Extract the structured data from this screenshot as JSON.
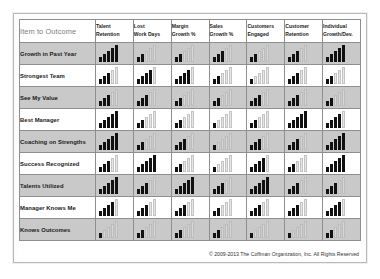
{
  "header": {
    "corner_label": "Item to Outcome",
    "columns": [
      {
        "line1": "Talent",
        "line2": "Retention"
      },
      {
        "line1": "Lost",
        "line2": "Work Days"
      },
      {
        "line1": "Margin",
        "line2": "Growth %"
      },
      {
        "line1": "Sales",
        "line2": "Growth %"
      },
      {
        "line1": "Customers",
        "line2": "Engaged"
      },
      {
        "line1": "Customer",
        "line2": "Retention"
      },
      {
        "line1": "Individual",
        "line2": "Growth/Dev."
      }
    ]
  },
  "footer": {
    "copyright": "© 2009-2013 The Coffman Organization, Inc. All Rights Reserved"
  },
  "colors": {
    "bar_filled": "#111111",
    "bar_empty": "#e6e6e6",
    "band_gray": "#c9c9c9",
    "band_white": "#ffffff",
    "grid_line": "#8f8f8f",
    "frame_border": "#b9b9b9"
  },
  "chart_data": {
    "type": "heatmap",
    "title": "Item to Outcome",
    "xlabel": "",
    "ylabel": "",
    "scale_max": 5,
    "legend": "Each cell shows 5 ascending bars; the count of dark-filled bars encodes the strength of the item-to-outcome linkage (0-5).",
    "categories": [
      "Talent Retention",
      "Lost Work Days",
      "Margin Growth %",
      "Sales Growth %",
      "Customers Engaged",
      "Customer Retention",
      "Individual Growth/Dev."
    ],
    "rows": [
      "Growth in Past Year",
      "Strongest Team",
      "See My Value",
      "Best Manager",
      "Coaching on Strengths",
      "Success Recognized",
      "Talents Utilized",
      "Manager Knows Me",
      "Knows Outcomes"
    ],
    "series": [
      {
        "name": "Growth in Past Year",
        "values": [
          5,
          2,
          2,
          3,
          2,
          3,
          5
        ]
      },
      {
        "name": "Strongest Team",
        "values": [
          3,
          4,
          4,
          2,
          1,
          3,
          2
        ]
      },
      {
        "name": "See My Value",
        "values": [
          3,
          3,
          2,
          2,
          3,
          3,
          2
        ]
      },
      {
        "name": "Best Manager",
        "values": [
          5,
          2,
          2,
          1,
          2,
          5,
          4
        ]
      },
      {
        "name": "Coaching on Strengths",
        "values": [
          5,
          2,
          3,
          1,
          3,
          3,
          5
        ]
      },
      {
        "name": "Success Recognized",
        "values": [
          3,
          5,
          2,
          1,
          4,
          2,
          5
        ]
      },
      {
        "name": "Talents Utilized",
        "values": [
          5,
          3,
          5,
          3,
          5,
          3,
          3
        ]
      },
      {
        "name": "Manager Knows Me",
        "values": [
          4,
          3,
          3,
          2,
          3,
          3,
          4
        ]
      },
      {
        "name": "Knows Outcomes",
        "values": [
          1,
          2,
          2,
          2,
          1,
          1,
          2
        ]
      }
    ]
  }
}
